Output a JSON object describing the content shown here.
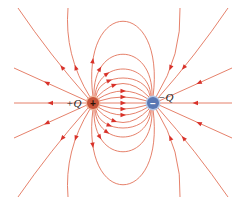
{
  "colors": {
    "field_line": "#e2735a",
    "arrow": "#d8322a",
    "positive_fill": "#c8553a",
    "positive_ring": "#f0b49a",
    "negative_fill": "#5a78b4",
    "negative_ring": "#b4c6e4",
    "label": "#222222"
  },
  "charges": [
    {
      "id": "positive",
      "label": "+Q",
      "sign": "+",
      "x": 93,
      "y": 103,
      "r": 6,
      "label_x": 66,
      "label_y": 107
    },
    {
      "id": "negative",
      "label": "−Q",
      "sign": "−",
      "x": 153,
      "y": 103,
      "r": 6,
      "label_x": 158,
      "label_y": 101
    }
  ],
  "field_lines": [
    {
      "name": "axis-between",
      "d": "M99 103 L147 103",
      "arrow": [
        0.5
      ]
    },
    {
      "name": "inner-top-1",
      "d": "M99 101 Q123 93 147 101",
      "arrow": [
        0.5
      ]
    },
    {
      "name": "inner-top-2",
      "d": "M98 99 Q123 83 148 99",
      "arrow": [
        0.5
      ]
    },
    {
      "name": "inner-top-3",
      "d": "M97 97 Q123 70 149 97",
      "arrow": [
        0.35
      ]
    },
    {
      "name": "inner-top-4",
      "d": "M96 96 C100 72 146 72 150 96",
      "arrow": [
        0.3
      ]
    },
    {
      "name": "inner-top-5",
      "d": "M95 96 C98 60 148 60 151 96",
      "arrow": [
        0.3
      ]
    },
    {
      "name": "inner-top-6",
      "d": "M94 97 C92 40 154 40 152 97",
      "arrow": [
        0.25
      ]
    },
    {
      "name": "inner-top-7",
      "d": "M93 97 C80 -4 166 -4 153 97",
      "arrow": [
        0.2
      ]
    },
    {
      "name": "inner-bot-1",
      "d": "M99 105 Q123 113 147 105",
      "arrow": [
        0.5
      ]
    },
    {
      "name": "inner-bot-2",
      "d": "M98 107 Q123 123 148 107",
      "arrow": [
        0.5
      ]
    },
    {
      "name": "inner-bot-3",
      "d": "M97 109 Q123 136 149 109",
      "arrow": [
        0.35
      ]
    },
    {
      "name": "inner-bot-4",
      "d": "M96 110 C100 134 146 134 150 110",
      "arrow": [
        0.3
      ]
    },
    {
      "name": "inner-bot-5",
      "d": "M95 110 C98 146 148 146 151 110",
      "arrow": [
        0.3
      ]
    },
    {
      "name": "inner-bot-6",
      "d": "M94 109 C92 166 154 166 152 109",
      "arrow": [
        0.25
      ]
    },
    {
      "name": "inner-bot-7",
      "d": "M93 109 C80 210 166 210 153 109",
      "arrow": [
        0.2
      ]
    },
    {
      "name": "left-axis",
      "d": "M87 103 L14 103",
      "arrow": [
        0.5
      ]
    },
    {
      "name": "left-upper-1",
      "d": "M87 101 L14 68",
      "arrow": [
        0.55
      ]
    },
    {
      "name": "left-upper-2",
      "d": "M88 98 Q50 55 18 8",
      "arrow": [
        0.35
      ]
    },
    {
      "name": "left-upper-3",
      "d": "M90 97 Q64 55 68 8",
      "arrow": [
        0.35
      ]
    },
    {
      "name": "left-lower-1",
      "d": "M87 105 L14 138",
      "arrow": [
        0.55
      ]
    },
    {
      "name": "left-lower-2",
      "d": "M88 108 Q50 151 18 197",
      "arrow": [
        0.35
      ]
    },
    {
      "name": "left-lower-3",
      "d": "M90 109 Q64 151 68 197",
      "arrow": [
        0.35
      ]
    },
    {
      "name": "right-axis",
      "d": "M232 103 L159 103",
      "arrow": [
        0.5
      ]
    },
    {
      "name": "right-upper-1",
      "d": "M232 68 L159 101",
      "arrow": [
        0.45
      ]
    },
    {
      "name": "right-upper-2",
      "d": "M228 8 Q196 55 158 98",
      "arrow": [
        0.65
      ]
    },
    {
      "name": "right-upper-3",
      "d": "M180 8 Q182 55 156 97",
      "arrow": [
        0.65
      ]
    },
    {
      "name": "right-lower-1",
      "d": "M232 138 L159 105",
      "arrow": [
        0.45
      ]
    },
    {
      "name": "right-lower-2",
      "d": "M228 197 Q196 151 158 108",
      "arrow": [
        0.65
      ]
    },
    {
      "name": "right-lower-3",
      "d": "M180 197 Q182 151 156 109",
      "arrow": [
        0.65
      ]
    }
  ]
}
